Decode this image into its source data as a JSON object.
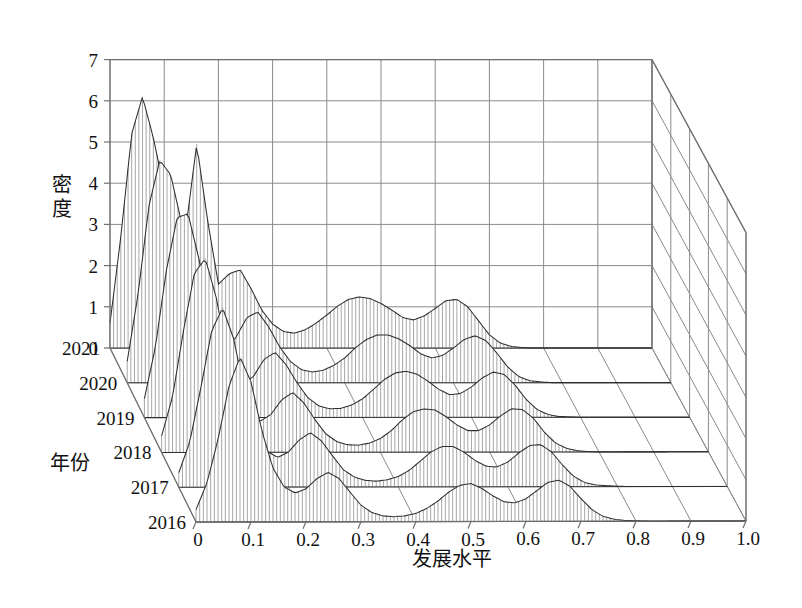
{
  "figure": {
    "kind": "3d-waterfall-density-surface",
    "background_color": "#ffffff",
    "grid_color": "#8a8a8a",
    "mesh_color": "#5b5b5b",
    "ridge_color": "#2e2e2e"
  },
  "axes": {
    "x": {
      "title": "发展水平",
      "ticks": [
        "0",
        "0.1",
        "0.2",
        "0.3",
        "0.4",
        "0.5",
        "0.6",
        "0.7",
        "0.8",
        "0.9",
        "1.0"
      ],
      "values": [
        0,
        0.1,
        0.2,
        0.3,
        0.4,
        0.5,
        0.6,
        0.7,
        0.8,
        0.9,
        1.0
      ],
      "range": [
        0,
        1.0
      ]
    },
    "y": {
      "title": "年份",
      "ticks": [
        "2016",
        "2017",
        "2018",
        "2019",
        "2020",
        "2021"
      ],
      "values": [
        2016,
        2017,
        2018,
        2019,
        2020,
        2021
      ],
      "range": [
        2016,
        2021
      ]
    },
    "z": {
      "title": "密度",
      "ticks": [
        "0",
        "1",
        "2",
        "3",
        "4",
        "5",
        "6",
        "7"
      ],
      "values": [
        0,
        1,
        2,
        3,
        4,
        5,
        6,
        7
      ],
      "range": [
        0,
        7
      ]
    }
  },
  "chart_data": {
    "type": "line",
    "title": "",
    "xlabel": "发展水平",
    "ylabel": "年份",
    "zlabel": "密度",
    "xlim": [
      0,
      1.0
    ],
    "ylim": [
      2016,
      2021
    ],
    "zlim": [
      0,
      7
    ],
    "grid": true,
    "legend": "none",
    "x": [
      0.0,
      0.02,
      0.04,
      0.06,
      0.08,
      0.1,
      0.12,
      0.14,
      0.16,
      0.18,
      0.2,
      0.22,
      0.24,
      0.26,
      0.28,
      0.3,
      0.32,
      0.34,
      0.36,
      0.38,
      0.4,
      0.42,
      0.44,
      0.46,
      0.48,
      0.5,
      0.52,
      0.54,
      0.56,
      0.58,
      0.6,
      0.62,
      0.64,
      0.66,
      0.68,
      0.7,
      0.72,
      0.74,
      0.76,
      0.78,
      0.8,
      0.82,
      0.84,
      0.86,
      0.88,
      0.9,
      0.92,
      0.94,
      0.96,
      0.98,
      1.0
    ],
    "series": [
      {
        "name": "2016",
        "values": [
          0.3,
          0.95,
          2.0,
          3.3,
          4.0,
          3.4,
          2.2,
          1.3,
          0.85,
          0.7,
          0.8,
          1.05,
          1.2,
          1.05,
          0.72,
          0.4,
          0.22,
          0.14,
          0.12,
          0.14,
          0.2,
          0.32,
          0.5,
          0.72,
          0.88,
          0.92,
          0.8,
          0.62,
          0.48,
          0.45,
          0.55,
          0.75,
          0.95,
          1.0,
          0.85,
          0.55,
          0.28,
          0.12,
          0.05,
          0.02,
          0.01,
          0.0,
          0.0,
          0.0,
          0.0,
          0.0,
          0.0,
          0.0,
          0.0,
          0.0,
          0.0
        ]
      },
      {
        "name": "2017",
        "values": [
          0.35,
          1.1,
          2.4,
          3.8,
          4.35,
          3.6,
          2.3,
          1.35,
          0.88,
          0.72,
          0.85,
          1.15,
          1.32,
          1.12,
          0.76,
          0.42,
          0.24,
          0.16,
          0.14,
          0.17,
          0.25,
          0.4,
          0.62,
          0.85,
          0.98,
          0.98,
          0.84,
          0.64,
          0.5,
          0.48,
          0.6,
          0.82,
          1.0,
          1.02,
          0.84,
          0.52,
          0.25,
          0.1,
          0.04,
          0.02,
          0.01,
          0.0,
          0.0,
          0.0,
          0.0,
          0.0,
          0.0,
          0.0,
          0.0,
          0.0,
          0.0
        ]
      },
      {
        "name": "2018",
        "values": [
          0.4,
          1.35,
          2.95,
          4.35,
          4.7,
          3.75,
          2.35,
          1.4,
          0.9,
          0.75,
          0.92,
          1.28,
          1.45,
          1.2,
          0.8,
          0.45,
          0.26,
          0.18,
          0.17,
          0.22,
          0.33,
          0.52,
          0.78,
          0.98,
          1.05,
          1.02,
          0.86,
          0.66,
          0.52,
          0.52,
          0.66,
          0.88,
          1.05,
          1.03,
          0.82,
          0.48,
          0.22,
          0.09,
          0.03,
          0.01,
          0.0,
          0.0,
          0.0,
          0.0,
          0.0,
          0.0,
          0.0,
          0.0,
          0.0,
          0.0,
          0.0
        ]
      },
      {
        "name": "2019",
        "values": [
          0.46,
          1.7,
          3.55,
          4.85,
          4.95,
          3.85,
          2.38,
          1.42,
          0.92,
          0.8,
          1.0,
          1.42,
          1.58,
          1.28,
          0.84,
          0.48,
          0.28,
          0.21,
          0.22,
          0.3,
          0.45,
          0.68,
          0.92,
          1.08,
          1.12,
          1.05,
          0.88,
          0.68,
          0.55,
          0.58,
          0.74,
          0.96,
          1.1,
          1.04,
          0.78,
          0.44,
          0.19,
          0.07,
          0.02,
          0.01,
          0.0,
          0.0,
          0.0,
          0.0,
          0.0,
          0.0,
          0.0,
          0.0,
          0.0,
          0.0,
          0.0
        ]
      },
      {
        "name": "2020",
        "values": [
          0.52,
          2.15,
          4.3,
          5.4,
          5.05,
          3.88,
          2.4,
          1.45,
          0.95,
          0.86,
          1.1,
          1.58,
          1.72,
          1.36,
          0.88,
          0.52,
          0.32,
          0.26,
          0.3,
          0.42,
          0.6,
          0.85,
          1.05,
          1.16,
          1.16,
          1.06,
          0.9,
          0.7,
          0.6,
          0.66,
          0.84,
          1.05,
          1.14,
          1.02,
          0.72,
          0.38,
          0.15,
          0.05,
          0.02,
          0.0,
          0.0,
          0.0,
          0.0,
          0.0,
          0.0,
          0.0,
          0.0,
          0.0,
          0.0,
          0.0,
          0.0
        ]
      },
      {
        "name": "2021",
        "values": [
          0.6,
          2.7,
          5.2,
          6.1,
          5.1,
          3.85,
          2.4,
          2.9,
          4.95,
          3.1,
          1.55,
          1.8,
          1.9,
          1.45,
          0.92,
          0.58,
          0.4,
          0.36,
          0.44,
          0.6,
          0.8,
          1.02,
          1.18,
          1.24,
          1.2,
          1.08,
          0.92,
          0.74,
          0.68,
          0.78,
          0.96,
          1.15,
          1.18,
          1.0,
          0.66,
          0.32,
          0.12,
          0.04,
          0.01,
          0.0,
          0.0,
          0.0,
          0.0,
          0.0,
          0.0,
          0.0,
          0.0,
          0.0,
          0.0,
          0.0,
          0.0
        ]
      }
    ],
    "notes": {
      "peak_2021_primary": {
        "x": 0.06,
        "z": 6.1
      },
      "peak_2021_secondary": {
        "x": 0.16,
        "z": 4.95
      },
      "tail_flat_from_x": 0.8
    }
  },
  "projection": {
    "origin_back_left": [
      110,
      348
    ],
    "origin_front_left": [
      196,
      522
    ],
    "front_right": [
      746,
      521
    ],
    "back_right": [
      652,
      348
    ],
    "z_unit_px": 41.2,
    "z_top_back_left": [
      110,
      59
    ]
  }
}
